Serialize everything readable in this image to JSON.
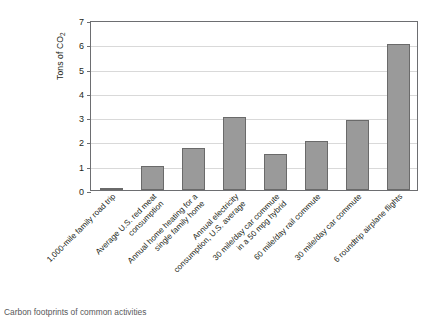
{
  "chart_data": {
    "type": "bar",
    "title": "",
    "xlabel": "",
    "ylabel": "Tons of CO",
    "ylabel_sub": "2",
    "ylim": [
      0,
      7
    ],
    "ytick_labels": [
      "0",
      "1",
      "2",
      "3",
      "4",
      "5",
      "6",
      "7"
    ],
    "ytick_values": [
      0,
      1,
      2,
      3,
      4,
      5,
      6,
      7
    ],
    "grid": true,
    "legend": "none",
    "bar_color": "#9a9a9a",
    "bar_border_color": "#6a6a6a",
    "axis_color": "#6d6e71",
    "grid_color": "#d9d9d9",
    "categories": [
      "1,000-mile family road trip",
      "Average U.S. red meat\nconsumption",
      "Annual home heating for a\nsingle family home",
      "Annual electricity\nconsumption, U.S. average",
      "30 mile/day car commute\nin a 50 mpg hybrid",
      "60 mile/day rail commute",
      "30 mile/day car commute",
      "6 roundtrip airplane flights"
    ],
    "values": [
      0.08,
      1.0,
      1.75,
      3.0,
      1.5,
      2.0,
      2.9,
      6.0
    ]
  },
  "caption": {
    "text": "Carbon footprints of common activities"
  }
}
